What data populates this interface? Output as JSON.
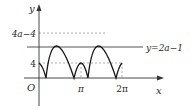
{
  "diagram": {
    "type": "function-graph",
    "axes": {
      "x_label": "x",
      "y_label": "y",
      "origin_label": "O"
    },
    "x_ticks": [
      {
        "label": "π",
        "value": "pi"
      },
      {
        "label": "2π",
        "value": "2pi"
      }
    ],
    "y_ticks": [
      {
        "label": "4a−4",
        "role": "peak-level"
      },
      {
        "label": "4",
        "role": "small-hump-level"
      }
    ],
    "horizontal_line": {
      "label": "y=2a−1",
      "style": "solid"
    },
    "curve": {
      "description": "absolute-value periodic curve: starts at 4 at x=0, large arches reaching 4a−4, small arch reaching 4 at x=π, returns toward 4 at x=2π",
      "stroke": "#1a1a1a"
    },
    "colors": {
      "axis": "#333333",
      "curve": "#1a1a1a",
      "dashed": "#9a9a9a",
      "line": "#555555"
    }
  }
}
